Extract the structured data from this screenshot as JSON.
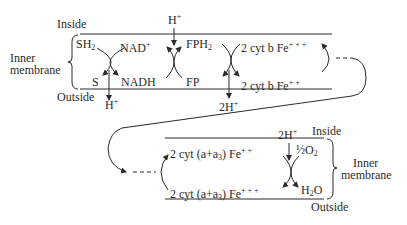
{
  "diagram": {
    "type": "electron-transport-chain-membrane",
    "top_section": {
      "labels": {
        "inside": "Inside",
        "outside": "Outside",
        "inner_membrane_line1": "Inner",
        "inner_membrane_line2": "membrane"
      },
      "nodes": {
        "sh2": "SH",
        "sh2_sub": "2",
        "nad_plus": "NAD",
        "nad_plus_sup": "+",
        "s": "S",
        "nadh": "NADH",
        "fph2": "FPH",
        "fph2_sub": "2",
        "fp": "FP",
        "cyt_b_fe3": "2 cyt b Fe",
        "cyt_b_fe3_sup": "+ + +",
        "cyt_b_fe2": "2 cyt b Fe",
        "cyt_b_fe2_sup": "+ +",
        "h_plus_in": "H",
        "h_plus_in_sup": "+",
        "h_plus_out": "H",
        "h_plus_out_sup": "+",
        "two_h_plus_out": "2H",
        "two_h_plus_out_sup": "+"
      }
    },
    "bottom_section": {
      "labels": {
        "inside": "Inside",
        "outside": "Outside",
        "inner_membrane_line1": "Inner",
        "inner_membrane_line2": "membrane"
      },
      "nodes": {
        "cyt_aa3_fe2": "2 cyt (a+a",
        "cyt_aa3_fe2_sub": "3",
        "cyt_aa3_fe2_tail": ") Fe",
        "cyt_aa3_fe2_sup": "+ +",
        "cyt_aa3_fe3": "2 cyt (a+a",
        "cyt_aa3_fe3_sub": "3",
        "cyt_aa3_fe3_tail": ") Fe",
        "cyt_aa3_fe3_sup": "+ + +",
        "half_o2": "½O",
        "half_o2_sub": "2",
        "h2o": "H",
        "h2o_sub": "2",
        "h2o_tail": "O",
        "two_h_plus_in": "2H",
        "two_h_plus_in_sup": "+"
      }
    },
    "colors": {
      "ink": "#2b2b2b",
      "background": "#ffffff"
    }
  }
}
